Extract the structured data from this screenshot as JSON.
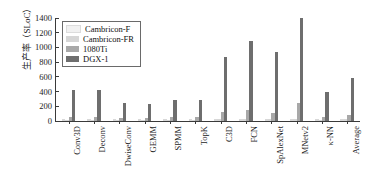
{
  "chart_data": {
    "type": "bar",
    "title": "",
    "xlabel": "",
    "ylabel": "生产率（SLoC）",
    "ylim": [
      0,
      1400
    ],
    "ytick_labels": [
      "1400",
      "1200",
      "1000",
      "800",
      "600",
      "400",
      "200",
      "0"
    ],
    "ytick_values": [
      1400,
      1200,
      1000,
      800,
      600,
      400,
      200,
      0
    ],
    "grid": false,
    "legend_position": "upper-left",
    "categories": [
      "Conv3D",
      "Deconv",
      "DwiseConv",
      "GEMM",
      "SPMM",
      "TopK",
      "C3D",
      "FCN",
      "SpAlexNet",
      "MNetv2",
      "κ-NN",
      "Average"
    ],
    "series": [
      {
        "name": "Cambricon-F",
        "color": "#f1f1f1",
        "values": [
          10,
          10,
          8,
          8,
          10,
          10,
          14,
          16,
          14,
          18,
          10,
          12
        ]
      },
      {
        "name": "Cambricon-FR",
        "color": "#d6d6d6",
        "values": [
          20,
          20,
          16,
          16,
          20,
          20,
          28,
          30,
          26,
          34,
          20,
          24
        ]
      },
      {
        "name": "1080Ti",
        "color": "#a8a8a8",
        "values": [
          60,
          60,
          40,
          45,
          60,
          55,
          120,
          150,
          105,
          245,
          60,
          85
        ]
      },
      {
        "name": "DGX-1",
        "color": "#6e6e6e",
        "values": [
          420,
          420,
          245,
          230,
          290,
          290,
          870,
          1090,
          940,
          1395,
          390,
          590
        ]
      }
    ]
  },
  "legend": {
    "entries": [
      {
        "label": "Cambricon-F"
      },
      {
        "label": "Cambricon-FR"
      },
      {
        "label": "1080Ti"
      },
      {
        "label": "DGX-1"
      }
    ]
  }
}
